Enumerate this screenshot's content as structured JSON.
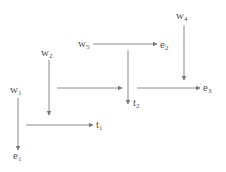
{
  "diagram": {
    "type": "flow-diagram",
    "colors": {
      "line": "#8a8a8a",
      "text": "#555555",
      "background": "#ffffff"
    },
    "nodes": [
      {
        "id": "w1",
        "base": "w",
        "sub": "1",
        "x": 10,
        "y": 93
      },
      {
        "id": "w2",
        "base": "w",
        "sub": "2",
        "x": 41,
        "y": 56
      },
      {
        "id": "w5",
        "base": "w",
        "sub": "5",
        "x": 78,
        "y": 47
      },
      {
        "id": "w4",
        "base": "w",
        "sub": "4",
        "x": 176,
        "y": 19
      },
      {
        "id": "e1",
        "base": "e",
        "sub": "1",
        "x": 13,
        "y": 159
      },
      {
        "id": "t1",
        "base": "t",
        "sub": "1",
        "x": 96,
        "y": 128
      },
      {
        "id": "e2",
        "base": "e",
        "sub": "2",
        "x": 160,
        "y": 48
      },
      {
        "id": "t2",
        "base": "t",
        "sub": "2",
        "x": 133,
        "y": 106
      },
      {
        "id": "e3",
        "base": "e",
        "sub": "3",
        "x": 203,
        "y": 91
      }
    ],
    "edges": [
      {
        "id": "w1-e1",
        "x1": 18,
        "y1": 98,
        "x2": 18,
        "y2": 150
      },
      {
        "id": "w2-down",
        "x1": 49,
        "y1": 60,
        "x2": 49,
        "y2": 115
      },
      {
        "id": "to-t1",
        "x1": 26,
        "y1": 125,
        "x2": 93,
        "y2": 125
      },
      {
        "id": "w5-e2",
        "x1": 93,
        "y1": 44,
        "x2": 157,
        "y2": 44
      },
      {
        "id": "to-t2",
        "x1": 128,
        "y1": 50,
        "x2": 128,
        "y2": 104
      },
      {
        "id": "to-t2-line",
        "x1": 57,
        "y1": 88,
        "x2": 122,
        "y2": 88
      },
      {
        "id": "to-e3",
        "x1": 137,
        "y1": 88,
        "x2": 200,
        "y2": 88
      },
      {
        "id": "w4-down",
        "x1": 184,
        "y1": 25,
        "x2": 184,
        "y2": 80
      }
    ]
  }
}
